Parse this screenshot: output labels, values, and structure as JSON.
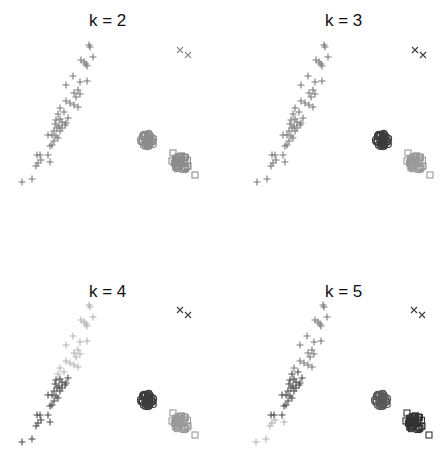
{
  "figure": {
    "panels": [
      {
        "title": "k = 2"
      },
      {
        "title": "k = 3"
      },
      {
        "title": "k = 4"
      },
      {
        "title": "k = 5"
      }
    ]
  },
  "chart_data": [
    {
      "type": "scatter",
      "title": "k = 2",
      "k": 2,
      "axes_visible": false,
      "groups": [
        {
          "name": "elongated diagonal group",
          "marker": "plus",
          "cluster_color": "#7a7a7a"
        },
        {
          "name": "round group",
          "marker": "circle",
          "cluster_color": "#8c8c8c"
        },
        {
          "name": "square group",
          "marker": "square",
          "cluster_color": "#8c8c8c"
        },
        {
          "name": "outlier pair",
          "marker": "x",
          "cluster_color": "#8c8c8c"
        }
      ]
    },
    {
      "type": "scatter",
      "title": "k = 3",
      "k": 3,
      "axes_visible": false,
      "groups": [
        {
          "name": "elongated diagonal group",
          "marker": "plus",
          "cluster_color": "#7a7a7a"
        },
        {
          "name": "round group",
          "marker": "circle",
          "cluster_color": "#3c3c3c"
        },
        {
          "name": "square group",
          "marker": "square",
          "cluster_color": "#9a9a9a"
        },
        {
          "name": "outlier pair",
          "marker": "x",
          "cluster_color": "#3c3c3c"
        }
      ]
    },
    {
      "type": "scatter",
      "title": "k = 4",
      "k": 4,
      "axes_visible": false,
      "groups": [
        {
          "name": "elongated diagonal group (upper)",
          "marker": "plus",
          "cluster_color": "#b4b4b4"
        },
        {
          "name": "elongated diagonal group (lower)",
          "marker": "plus",
          "cluster_color": "#4a4a4a"
        },
        {
          "name": "round group",
          "marker": "circle",
          "cluster_color": "#3c3c3c"
        },
        {
          "name": "square group",
          "marker": "square",
          "cluster_color": "#9a9a9a"
        },
        {
          "name": "outlier pair",
          "marker": "x",
          "cluster_color": "#3c3c3c"
        }
      ]
    },
    {
      "type": "scatter",
      "title": "k = 5",
      "k": 5,
      "axes_visible": false,
      "groups": [
        {
          "name": "elongated diagonal group (upper)",
          "marker": "plus",
          "cluster_color": "#7a7a7a"
        },
        {
          "name": "elongated diagonal group (middle)",
          "marker": "plus",
          "cluster_color": "#4a4a4a"
        },
        {
          "name": "elongated diagonal group (lower)",
          "marker": "plus",
          "cluster_color": "#b4b4b4"
        },
        {
          "name": "round group",
          "marker": "circle",
          "cluster_color": "#5a5a5a"
        },
        {
          "name": "square group",
          "marker": "square",
          "cluster_color": "#333333"
        },
        {
          "name": "outlier pair",
          "marker": "x",
          "cluster_color": "#3c3c3c"
        }
      ]
    }
  ],
  "layout": {
    "panel_offsets": [
      [
        0,
        0
      ],
      [
        223,
        0
      ],
      [
        0,
        232
      ],
      [
        223,
        232
      ]
    ],
    "title_pos": [
      [
        89,
        11
      ],
      [
        102,
        11
      ],
      [
        89,
        50
      ],
      [
        102,
        50
      ]
    ],
    "plot_shift_y": [
      0,
      0,
      28,
      28
    ],
    "plot_shift_x": [
      0,
      12,
      0,
      11
    ]
  },
  "points": {
    "plus": [
      [
        89,
        45
      ],
      [
        90,
        47
      ],
      [
        93,
        57
      ],
      [
        81,
        60
      ],
      [
        84,
        62
      ],
      [
        86,
        64
      ],
      [
        87,
        66
      ],
      [
        73,
        76
      ],
      [
        66,
        85
      ],
      [
        80,
        82
      ],
      [
        87,
        81
      ],
      [
        78,
        90
      ],
      [
        74,
        93
      ],
      [
        80,
        94
      ],
      [
        76,
        97
      ],
      [
        66,
        101
      ],
      [
        70,
        103
      ],
      [
        74,
        105
      ],
      [
        78,
        107
      ],
      [
        60,
        108
      ],
      [
        58,
        114
      ],
      [
        64,
        112
      ],
      [
        68,
        118
      ],
      [
        60,
        119
      ],
      [
        56,
        120
      ],
      [
        62,
        122
      ],
      [
        55,
        124
      ],
      [
        65,
        125
      ],
      [
        59,
        126
      ],
      [
        57,
        128
      ],
      [
        62,
        128
      ],
      [
        54,
        131
      ],
      [
        60,
        131
      ],
      [
        66,
        123
      ],
      [
        52,
        135
      ],
      [
        48,
        135
      ],
      [
        56,
        136
      ],
      [
        58,
        138
      ],
      [
        54,
        141
      ],
      [
        52,
        145
      ],
      [
        50,
        146
      ],
      [
        40,
        155
      ],
      [
        37,
        155
      ],
      [
        48,
        155
      ],
      [
        41,
        160
      ],
      [
        38,
        163
      ],
      [
        36,
        166
      ],
      [
        50,
        162
      ],
      [
        22,
        182
      ],
      [
        32,
        179
      ]
    ],
    "circle_center": [
      148,
      140
    ],
    "square_center": [
      181,
      163
    ],
    "square_extra": [
      [
        173,
        153
      ],
      [
        172,
        161
      ],
      [
        195,
        175
      ],
      [
        188,
        166
      ]
    ],
    "x_markers": [
      [
        180,
        50
      ],
      [
        188,
        55
      ]
    ]
  },
  "cluster_membership": {
    "plus_split_k4": 22,
    "plus_split_k5": [
      20,
      44
    ]
  }
}
